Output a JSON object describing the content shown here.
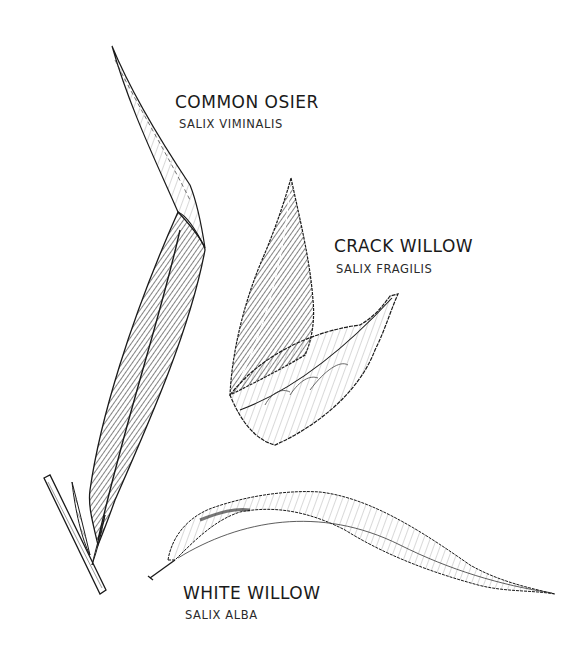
{
  "illustration": {
    "subject": "Willow leaves",
    "colors": {
      "ink": "#1a1a1a",
      "paper": "#ffffff"
    },
    "species": [
      {
        "common_name": "COMMON OSIER",
        "latin_name": "SALIX VIMINALIS"
      },
      {
        "common_name": "CRACK WILLOW",
        "latin_name": "SALIX FRAGILIS"
      },
      {
        "common_name": "WHITE WILLOW",
        "latin_name": "SALIX ALBA"
      }
    ]
  }
}
